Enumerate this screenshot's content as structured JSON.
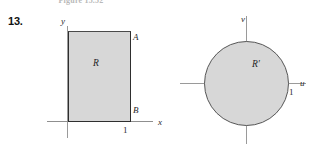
{
  "figure": {
    "caption": "Figure 15.52",
    "problem_number": "13."
  },
  "panels": [
    {
      "id": "xy-plane",
      "axes": {
        "horizontal": "x",
        "vertical": "y"
      },
      "region_label": "R",
      "point_labels": {
        "top_right": "A",
        "bottom_right": "B"
      },
      "ticks": {
        "x_one": "1"
      }
    },
    {
      "id": "uv-plane",
      "axes": {
        "horizontal": "u",
        "vertical": "v"
      },
      "region_label": "R′",
      "ticks": {
        "u_one": "1"
      }
    }
  ],
  "colors": {
    "region_fill": "#d7d7d7",
    "region_stroke": "#2e2e2e",
    "circle_stroke": "#565656",
    "axis": "#9a9a9a",
    "text": "#1f1f1f",
    "background": "#ffffff"
  }
}
